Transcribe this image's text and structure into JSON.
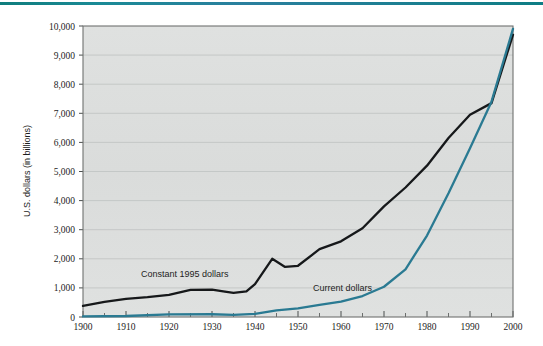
{
  "figure": {
    "top_rule_color": "#177f92",
    "plot_bg_color": "#dcdedd",
    "plot_border_color": "#6f7270",
    "gridline_color": "#c2c5c4"
  },
  "chart_data": {
    "type": "line",
    "title": "",
    "xlabel": "",
    "ylabel": "U.S. dollars (in billions)",
    "xlim": [
      1900,
      2000
    ],
    "ylim": [
      0,
      10000
    ],
    "grid": true,
    "legend_position": "inline-annotations",
    "x_ticks": [
      1900,
      1910,
      1920,
      1930,
      1940,
      1950,
      1960,
      1970,
      1980,
      1990,
      2000
    ],
    "x_tick_labels": [
      "1900",
      "1910",
      "1920",
      "1930",
      "1940",
      "1950",
      "1960",
      "1970",
      "1980",
      "1990",
      "2000"
    ],
    "x_minor_tick_interval": 5,
    "y_ticks": [
      0,
      1000,
      2000,
      3000,
      4000,
      5000,
      6000,
      7000,
      8000,
      9000,
      10000
    ],
    "y_tick_labels": [
      "0",
      "1,000",
      "2,000",
      "3,000",
      "4,000",
      "5,000",
      "6,000",
      "7,000",
      "8,000",
      "9,000",
      "10,000"
    ],
    "series": [
      {
        "name": "Constant 1995 dollars",
        "color": "#16181a",
        "width": 2.3,
        "annotation": {
          "text": "Constant 1995 dollars",
          "x": 1913.5,
          "y": 1380
        },
        "x": [
          1900,
          1905,
          1910,
          1915,
          1920,
          1925,
          1930,
          1933,
          1935,
          1938,
          1940,
          1944,
          1947,
          1950,
          1955,
          1960,
          1965,
          1970,
          1975,
          1980,
          1985,
          1990,
          1995,
          2000
        ],
        "y": [
          380,
          520,
          620,
          680,
          760,
          930,
          940,
          870,
          830,
          880,
          1130,
          2000,
          1720,
          1760,
          2330,
          2600,
          3050,
          3800,
          4450,
          5200,
          6150,
          6950,
          7350,
          9700
        ]
      },
      {
        "name": "Current dollars",
        "color": "#2a7a92",
        "width": 2.3,
        "annotation": {
          "text": "Current dollars",
          "x": 1953.5,
          "y": 900
        },
        "x": [
          1900,
          1910,
          1920,
          1930,
          1935,
          1940,
          1945,
          1950,
          1955,
          1960,
          1965,
          1970,
          1975,
          1980,
          1985,
          1990,
          1995,
          2000
        ],
        "y": [
          20,
          35,
          90,
          95,
          75,
          105,
          225,
          300,
          420,
          530,
          720,
          1040,
          1640,
          2800,
          4250,
          5800,
          7400,
          9900
        ]
      }
    ]
  }
}
